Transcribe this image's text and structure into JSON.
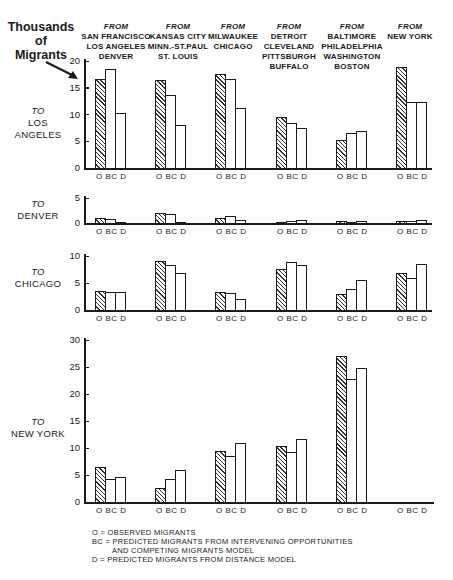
{
  "chart_data": {
    "type": "bar",
    "title": "",
    "ylabel": "Thousands of Migrants",
    "origin_groups": [
      "FROM SAN FRANCISCO LOS ANGELES DENVER",
      "FROM KANSAS CITY MINN.-ST.PAUL ST. LOUIS",
      "FROM MILWAUKEE CHICAGO",
      "FROM DETROIT CLEVELAND PITTSBURGH BUFFALO",
      "FROM BALTIMORE PHILADELPHIA WASHINGTON BOSTON",
      "FROM NEW YORK"
    ],
    "bar_categories": [
      "O",
      "BC",
      "D"
    ],
    "legend": {
      "O": "OBSERVED MIGRANTS",
      "BC": "PREDICTED MIGRANTS FROM INTERVENING OPPORTUNITIES AND COMPETING MIGRANTS MODEL",
      "D": "PREDICTED MIGRANTS FROM DISTANCE MODEL"
    },
    "panels": [
      {
        "destination": "TO LOS ANGELES",
        "ylim": [
          0,
          20
        ],
        "yticks": [
          0,
          5,
          10,
          15,
          20
        ],
        "series": [
          {
            "name": "O",
            "values": [
              16.6,
              16.5,
              17.6,
              9.6,
              5.3,
              18.9
            ]
          },
          {
            "name": "BC",
            "values": [
              18.5,
              13.6,
              16.7,
              8.4,
              6.5,
              12.3
            ]
          },
          {
            "name": "D",
            "values": [
              10.3,
              8.0,
              11.3,
              7.5,
              7.0,
              12.3
            ]
          }
        ]
      },
      {
        "destination": "TO DENVER",
        "ylim": [
          0,
          5
        ],
        "yticks": [
          0,
          5
        ],
        "series": [
          {
            "name": "O",
            "values": [
              1.1,
              2.0,
              1.1,
              0.3,
              0.5,
              0.5
            ]
          },
          {
            "name": "BC",
            "values": [
              0.8,
              1.8,
              1.4,
              0.4,
              0.3,
              0.4
            ]
          },
          {
            "name": "D",
            "values": [
              0.3,
              0.2,
              0.6,
              0.6,
              0.4,
              0.6
            ]
          }
        ]
      },
      {
        "destination": "TO CHICAGO",
        "ylim": [
          0,
          10
        ],
        "yticks": [
          0,
          5,
          10
        ],
        "series": [
          {
            "name": "O",
            "values": [
              3.6,
              9.0,
              3.4,
              7.6,
              2.9,
              6.8
            ]
          },
          {
            "name": "BC",
            "values": [
              3.4,
              8.4,
              3.1,
              8.8,
              3.8,
              5.9
            ]
          },
          {
            "name": "D",
            "values": [
              3.3,
              6.8,
              2.1,
              8.4,
              5.6,
              8.6
            ]
          }
        ]
      },
      {
        "destination": "TO NEW YORK",
        "ylim": [
          0,
          30
        ],
        "yticks": [
          0,
          5,
          10,
          15,
          20,
          25,
          30
        ],
        "series": [
          {
            "name": "O",
            "values": [
              6.5,
              2.6,
              9.5,
              10.3,
              27.0,
              null
            ]
          },
          {
            "name": "BC",
            "values": [
              4.2,
              4.3,
              8.5,
              9.2,
              22.8,
              null
            ]
          },
          {
            "name": "D",
            "values": [
              4.7,
              5.9,
              10.9,
              11.7,
              24.9,
              null
            ]
          }
        ]
      }
    ],
    "grid": false
  },
  "ylabel_lines": [
    "Thousands",
    "of",
    "Migrants"
  ],
  "columns": [
    {
      "from": "FROM",
      "lines": [
        "SAN FRANCISCO",
        "LOS ANGELES",
        "DENVER"
      ]
    },
    {
      "from": "FROM",
      "lines": [
        "KANSAS CITY",
        "MINN.-ST.PAUL",
        "ST. LOUIS"
      ]
    },
    {
      "from": "FROM",
      "lines": [
        "MILWAUKEE",
        "CHICAGO"
      ]
    },
    {
      "from": "FROM",
      "lines": [
        "DETROIT",
        "CLEVELAND",
        "PITTSBURGH",
        "BUFFALO"
      ]
    },
    {
      "from": "FROM",
      "lines": [
        "BALTIMORE",
        "PHILADELPHIA",
        "WASHINGTON",
        "BOSTON"
      ]
    },
    {
      "from": "FROM",
      "lines": [
        "NEW YORK"
      ]
    }
  ],
  "rows": [
    {
      "to": "TO",
      "lines": [
        "LOS",
        "ANGELES"
      ]
    },
    {
      "to": "TO",
      "lines": [
        "DENVER"
      ]
    },
    {
      "to": "TO",
      "lines": [
        "CHICAGO"
      ]
    },
    {
      "to": "TO",
      "lines": [
        "NEW YORK"
      ]
    }
  ],
  "bar_label_text": "O  BC  D",
  "legend_lines": [
    "O = OBSERVED MIGRANTS",
    "BC = PREDICTED MIGRANTS FROM INTERVENING OPPORTUNITIES",
    "AND COMPETING MIGRANTS MODEL",
    "D = PREDICTED MIGRANTS FROM DISTANCE MODEL"
  ]
}
